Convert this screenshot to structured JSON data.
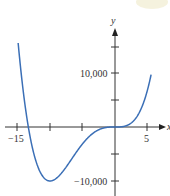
{
  "chart_data": {
    "type": "line",
    "title": "",
    "xlabel": "x",
    "ylabel": "y",
    "x_ticks": [
      -15,
      -10,
      -5,
      0,
      5
    ],
    "x_tick_labels": [
      "−15",
      "5"
    ],
    "y_tick_labels": [
      "10,000",
      "−10,000"
    ],
    "y_ticks": [
      -10000,
      -5000,
      0,
      5000,
      10000,
      15000
    ],
    "xlim": [
      -16.5,
      7
    ],
    "ylim": [
      -12500,
      17500
    ],
    "grid": false,
    "legend": null,
    "series": [
      {
        "name": "f(x)",
        "color": "#3b6fb6",
        "x": [
          -15,
          -14,
          -13.3,
          -12,
          -11,
          -10,
          -9,
          -8,
          -7,
          -6,
          -5,
          -4,
          -3,
          -2,
          -1,
          0,
          1,
          2,
          3,
          4,
          5
        ],
        "y": [
          17200,
          5900,
          0,
          -6700,
          -9100,
          -9900,
          -9400,
          -8000,
          -6200,
          -4600,
          -3100,
          -1900,
          -900,
          -270,
          -37,
          0,
          43,
          370,
          1320,
          3300,
          6900
        ]
      }
    ],
    "annotations": []
  },
  "labels": {
    "x_axis": "x",
    "y_axis": "y",
    "xtick_neg15": "−15",
    "xtick_5": "5",
    "ytick_10000": "10,000",
    "ytick_neg10000": "−10,000"
  },
  "colors": {
    "curve": "#3b6fb6",
    "axis": "#333333"
  }
}
